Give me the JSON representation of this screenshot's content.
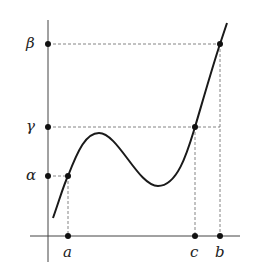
{
  "diagram": {
    "type": "function-graph",
    "x_labels": [
      {
        "name": "a",
        "x": 68
      },
      {
        "name": "c",
        "x": 195
      },
      {
        "name": "b",
        "x": 220
      }
    ],
    "y_labels": [
      {
        "name": "β",
        "y": 44
      },
      {
        "name": "γ",
        "y": 127
      },
      {
        "name": "α",
        "y": 176
      }
    ],
    "colors": {
      "curve": "#1a1a1a",
      "axis": "#444444",
      "dashed": "#666666",
      "point": "#111111"
    }
  }
}
